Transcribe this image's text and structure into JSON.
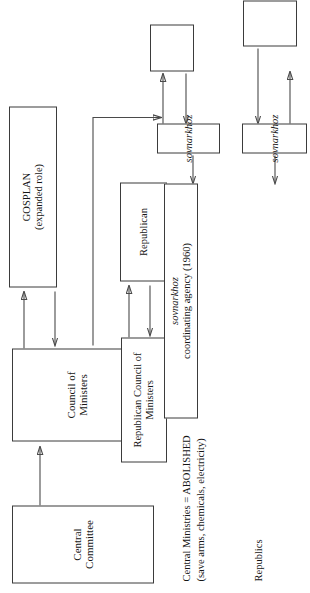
{
  "diagram": {
    "orientation": "rotated-90-ccw",
    "row_labels": [
      {
        "id": "republics",
        "label": "Republics"
      },
      {
        "id": "enterprises",
        "label": "Enterprises"
      }
    ],
    "notes": [
      {
        "id": "abolished-note",
        "line1": "Central Ministries = ABOLISHED",
        "line2": "(save arms, chemicals, electricity)"
      }
    ],
    "nodes": [
      {
        "id": "central-committee",
        "label": "Central Committee",
        "italic": false
      },
      {
        "id": "council-of-ministers",
        "label": "Council of Ministers",
        "italic": false
      },
      {
        "id": "gosplan",
        "label_caps": "GOSPLAN",
        "label_rest": " (expanded role)",
        "italic": false
      },
      {
        "id": "republican-council-of-ministers",
        "label": "Republican Council of Ministers",
        "italic": false
      },
      {
        "id": "republican",
        "label": "Republican",
        "italic": false
      },
      {
        "id": "sovnarkhoz-coordinating-agency",
        "label_ital": "sovnarkhoz",
        "label_rest": " coordinating agency (1960)"
      },
      {
        "id": "sovnarkhoz-1",
        "label": "sovnarkhoz",
        "italic": true
      },
      {
        "id": "sovnarkhoz-2",
        "label": "sovnarkhoz",
        "italic": true
      },
      {
        "id": "sovnarkhoz-3",
        "label": "sovnarkhoz",
        "italic": true
      },
      {
        "id": "enterprise-1",
        "label": "",
        "italic": false
      },
      {
        "id": "enterprise-2",
        "label": "",
        "italic": false
      },
      {
        "id": "enterprise-3",
        "label": "",
        "italic": false
      }
    ],
    "colors": {
      "box_border": "#3b3b3b",
      "wire": "#4a4a4a",
      "text": "#161616",
      "background": "#ffffff"
    }
  }
}
